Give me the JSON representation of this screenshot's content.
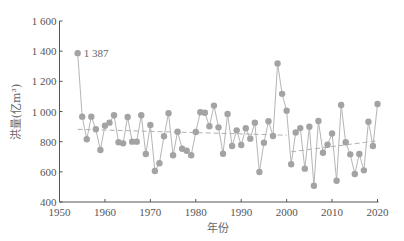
{
  "chart_data": {
    "type": "line",
    "title": "",
    "xlabel": "年份",
    "ylabel": "洪量(亿m³)",
    "xlim": [
      1950,
      2020
    ],
    "ylim": [
      400,
      1600
    ],
    "xticks": [
      1950,
      1960,
      1970,
      1980,
      1990,
      2000,
      2010,
      2020
    ],
    "yticks": [
      400,
      600,
      800,
      1000,
      1200,
      1400,
      1600
    ],
    "ytick_labels": [
      "400",
      "600",
      "800",
      "1 000",
      "1 200",
      "1 400",
      "1 600"
    ],
    "grid": false,
    "legend": null,
    "x": [
      1954,
      1955,
      1956,
      1957,
      1958,
      1959,
      1960,
      1961,
      1962,
      1963,
      1964,
      1965,
      1966,
      1967,
      1968,
      1969,
      1970,
      1971,
      1972,
      1973,
      1974,
      1975,
      1976,
      1977,
      1978,
      1979,
      1980,
      1981,
      1982,
      1983,
      1984,
      1985,
      1986,
      1987,
      1988,
      1989,
      1990,
      1991,
      1992,
      1993,
      1994,
      1995,
      1996,
      1997,
      1998,
      1999,
      2000,
      2001,
      2002,
      2003,
      2004,
      2005,
      2006,
      2007,
      2008,
      2009,
      2010,
      2011,
      2012,
      2013,
      2014,
      2015,
      2016,
      2017,
      2018,
      2019,
      2020
    ],
    "series": [
      {
        "name": "洪量",
        "values": [
          1387,
          966,
          816,
          966,
          882,
          745,
          906,
          926,
          975,
          796,
          789,
          964,
          800,
          800,
          975,
          718,
          911,
          606,
          657,
          836,
          988,
          710,
          866,
          753,
          740,
          710,
          864,
          995,
          992,
          902,
          1039,
          895,
          720,
          984,
          771,
          875,
          778,
          889,
          820,
          926,
          599,
          793,
          935,
          838,
          1318,
          1117,
          1005,
          650,
          861,
          890,
          621,
          899,
          508,
          937,
          727,
          780,
          854,
          541,
          1043,
          796,
          716,
          586,
          718,
          610,
          932,
          771,
          1050
        ]
      }
    ],
    "trend_lines": [
      {
        "name": "trend-1954-2000",
        "x": [
          1954,
          2000
        ],
        "y": [
          882,
          843
        ]
      },
      {
        "name": "trend-2001-2020",
        "x": [
          2001,
          2020
        ],
        "y": [
          733,
          806
        ]
      }
    ],
    "annotations": [
      {
        "x": 1954,
        "y": 1387,
        "text": "1 387"
      }
    ],
    "colors": {
      "marker": "#a3a3a3",
      "line": "#b5b5b5",
      "trend": "#b0b0b0",
      "axis": "#555555"
    }
  }
}
